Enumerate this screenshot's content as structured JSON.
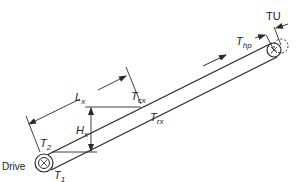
{
  "diagram": {
    "type": "inclined belt conveyor tension diagram",
    "colors": {
      "line": "#2a2a2a",
      "background": "#ffffff"
    },
    "labels": {
      "tu": "TU",
      "thp": {
        "base": "T",
        "sub": "hp"
      },
      "tcx": {
        "base": "T",
        "sub": "cx"
      },
      "trx": {
        "base": "T",
        "sub": "rx"
      },
      "lx": {
        "base": "L",
        "sub": "x"
      },
      "hx": {
        "base": "H",
        "sub": "x"
      },
      "t2": {
        "base": "T",
        "sub": "2"
      },
      "t1": {
        "base": "T",
        "sub": "1"
      },
      "drive": "Drive"
    },
    "components": [
      {
        "name": "drive-pulley",
        "position": "lower-left"
      },
      {
        "name": "tail-pulley",
        "position": "upper-right"
      },
      {
        "name": "conveyor-belt",
        "direction": "upward to the right"
      }
    ]
  }
}
